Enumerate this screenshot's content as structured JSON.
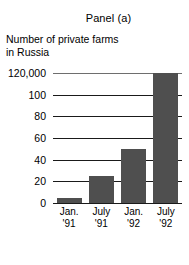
{
  "figure": {
    "title": "Panel (a)",
    "y_caption_lines": [
      "Number of private farms",
      "in Russia"
    ]
  },
  "chart_data": {
    "type": "bar",
    "title": "Panel (a)",
    "subtitle": "",
    "xlabel": "",
    "ylabel": "Number of private farms in Russia",
    "categories": [
      "Jan. '91",
      "July '91",
      "Jan. '92",
      "July '92"
    ],
    "category_lines": [
      [
        "Jan.",
        "'91"
      ],
      [
        "July",
        "'91"
      ],
      [
        "Jan.",
        "'92"
      ],
      [
        "July",
        "'92"
      ]
    ],
    "values": [
      5,
      25,
      50,
      120
    ],
    "value_unit": "thousands",
    "ylim": [
      0,
      120
    ],
    "yticks": [
      0,
      20,
      40,
      60,
      80,
      100,
      120
    ],
    "ytick_labels": [
      "0",
      "20",
      "40",
      "60",
      "80",
      "100",
      "120,000"
    ],
    "grid": true,
    "grid_axis": "y",
    "legend": false,
    "legend_position": "none",
    "bar_color": "#4f4f4f",
    "grid_color": "#1a1a1a",
    "background_color": "#ffffff"
  }
}
